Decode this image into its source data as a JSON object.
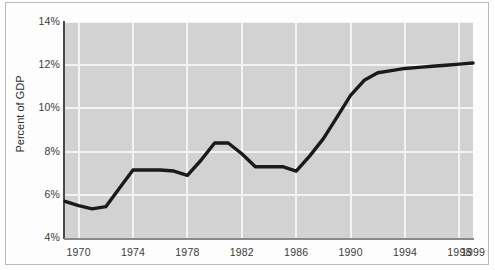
{
  "chart_data": {
    "type": "line",
    "title": "",
    "xlabel": "",
    "ylabel": "Percent of GDP",
    "xlim": [
      1969,
      1999
    ],
    "ylim": [
      4,
      14
    ],
    "grid": true,
    "legend": false,
    "y_ticks": [
      "4%",
      "6%",
      "8%",
      "10%",
      "12%",
      "14%"
    ],
    "y_tick_values": [
      4,
      6,
      8,
      10,
      12,
      14
    ],
    "x_ticks": [
      "1970",
      "1974",
      "1978",
      "1982",
      "1986",
      "1990",
      "1994",
      "1998",
      "1999"
    ],
    "x_tick_values": [
      1970,
      1974,
      1978,
      1982,
      1986,
      1990,
      1994,
      1998,
      1999
    ],
    "series": [
      {
        "name": "Percent of GDP",
        "color": "#1a1a1a",
        "x": [
          1969,
          1970,
          1971,
          1972,
          1973,
          1974,
          1975,
          1976,
          1977,
          1978,
          1979,
          1980,
          1981,
          1982,
          1983,
          1984,
          1985,
          1986,
          1987,
          1988,
          1989,
          1990,
          1991,
          1992,
          1993,
          1994,
          1995,
          1996,
          1997,
          1998,
          1999
        ],
        "values": [
          5.7,
          5.5,
          5.35,
          5.45,
          6.3,
          7.15,
          7.15,
          7.15,
          7.1,
          6.9,
          7.6,
          8.4,
          8.4,
          7.9,
          7.3,
          7.3,
          7.3,
          7.1,
          7.8,
          8.6,
          9.6,
          10.6,
          11.3,
          11.65,
          11.75,
          11.85,
          11.9,
          11.95,
          12.0,
          12.05,
          12.1
        ]
      }
    ]
  },
  "axis": {
    "y_label": "Percent of GDP"
  }
}
